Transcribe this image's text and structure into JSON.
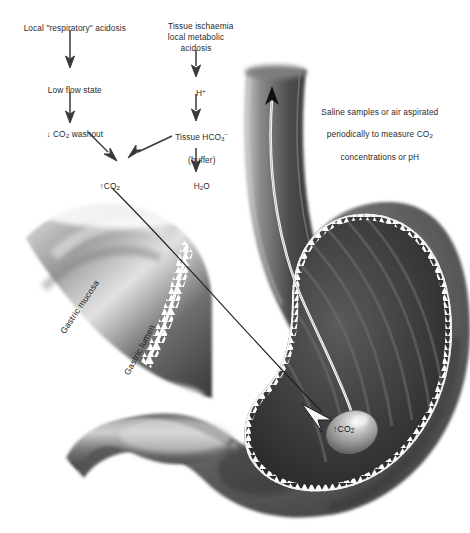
{
  "flowchart": {
    "left_column": [
      {
        "text": "Local \"respiratory\" acidosis"
      },
      {
        "text": "Low flow state"
      },
      {
        "prefix": "↓",
        "text": " CO",
        "sub": "2",
        "suffix": " washout"
      }
    ],
    "right_column": [
      {
        "text": "Tissue ischaemia\nlocal metabolic\nacidosis"
      },
      {
        "text": "H",
        "sup": "+"
      },
      {
        "text": "Tissue HCO",
        "sub": "3",
        "sup": "−",
        "second_line": "(buffer)"
      },
      {
        "text": "H",
        "sub": "2",
        "suffix": "O"
      }
    ],
    "converge_node": {
      "prefix": "↑",
      "text": "CO",
      "sub": "2"
    }
  },
  "annotations": {
    "aspiration": {
      "line1": "Saline samples or air aspirated",
      "line2": "periodically to measure CO",
      "line2_sub": "2",
      "line3": "concentrations or pH"
    },
    "gastric_mucosa": "Gastric mucosa",
    "gastric_lumen": "Gastric lumen",
    "balloon": {
      "prefix": "↑",
      "text": "CO",
      "sub": "2"
    }
  },
  "colors": {
    "background": "#ffffff",
    "text": "#2b2b2b",
    "arrow": "#3a3a3a",
    "tube": "#ffffff",
    "lumen_dark": "#2f2f2f",
    "wall_mid": "#6f6f6f"
  }
}
